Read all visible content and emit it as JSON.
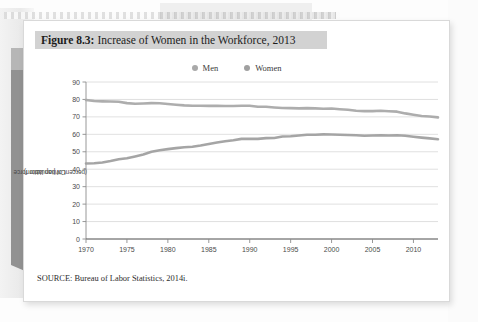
{
  "figure": {
    "title_prefix": "Figure 8.3:",
    "title_rest": "Increase of Women in the Workforce, 2013",
    "source": "SOURCE: Bureau of Labor Statistics, 2014i."
  },
  "colors": {
    "men_line": "#a9a9a9",
    "women_line": "#a0a0a0",
    "grid": "#d8d8d8",
    "axis": "#8c8c8c",
    "title_band": "#d2d2d2",
    "card": "#ffffff",
    "page_bg": "#fdfdfd",
    "spine": "#8a8a8a"
  },
  "chart_data": {
    "type": "line",
    "title": "Increase of Women in the Workforce, 2013",
    "xlabel": "",
    "ylabel": "Civilian labor force (percent of population)",
    "ylabel_line1": "Civilian labor force",
    "ylabel_line2": "(percent of population)",
    "xlim": [
      1970,
      2013
    ],
    "ylim": [
      0,
      90
    ],
    "ytick_step": 10,
    "grid": true,
    "legend_position": "top-center",
    "yticks": [
      0,
      10,
      20,
      30,
      40,
      50,
      60,
      70,
      80,
      90
    ],
    "xticks": [
      1970,
      1975,
      1980,
      1985,
      1990,
      1995,
      2000,
      2005,
      2010
    ],
    "x": [
      1970,
      1971,
      1972,
      1973,
      1974,
      1975,
      1976,
      1977,
      1978,
      1979,
      1980,
      1981,
      1982,
      1983,
      1984,
      1985,
      1986,
      1987,
      1988,
      1989,
      1990,
      1991,
      1992,
      1993,
      1994,
      1995,
      1996,
      1997,
      1998,
      1999,
      2000,
      2001,
      2002,
      2003,
      2004,
      2005,
      2006,
      2007,
      2008,
      2009,
      2010,
      2011,
      2012,
      2013
    ],
    "series": [
      {
        "name": "Men",
        "color": "#a9a9a9",
        "values": [
          79.7,
          79.1,
          78.9,
          78.8,
          78.7,
          77.9,
          77.5,
          77.7,
          77.9,
          77.8,
          77.4,
          77.0,
          76.6,
          76.4,
          76.4,
          76.3,
          76.3,
          76.2,
          76.2,
          76.4,
          76.4,
          75.8,
          75.8,
          75.4,
          75.1,
          75.0,
          74.9,
          75.0,
          74.9,
          74.7,
          74.8,
          74.4,
          74.1,
          73.5,
          73.3,
          73.3,
          73.5,
          73.2,
          73.0,
          72.0,
          71.2,
          70.5,
          70.2,
          69.7
        ]
      },
      {
        "name": "Women",
        "color": "#a0a0a0",
        "values": [
          43.3,
          43.4,
          43.9,
          44.7,
          45.7,
          46.3,
          47.3,
          48.4,
          50.0,
          50.9,
          51.5,
          52.1,
          52.6,
          52.9,
          53.6,
          54.5,
          55.3,
          56.0,
          56.6,
          57.4,
          57.5,
          57.4,
          57.8,
          57.9,
          58.8,
          58.9,
          59.3,
          59.8,
          59.8,
          60.0,
          59.9,
          59.8,
          59.6,
          59.5,
          59.2,
          59.3,
          59.4,
          59.3,
          59.5,
          59.2,
          58.6,
          58.1,
          57.7,
          57.2
        ]
      }
    ]
  },
  "legend": {
    "items": [
      {
        "label": "Men",
        "color": "#a9a9a9"
      },
      {
        "label": "Women",
        "color": "#a0a0a0"
      }
    ]
  }
}
